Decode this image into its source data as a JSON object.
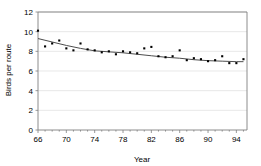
{
  "chart_data": {
    "type": "scatter",
    "title": "",
    "xlabel": "Year",
    "ylabel": "Birds per route",
    "xlim": [
      66,
      95.5
    ],
    "ylim": [
      0,
      12
    ],
    "grid": true,
    "legend": "none",
    "xticks": [
      66,
      70,
      74,
      78,
      82,
      86,
      90,
      94
    ],
    "xtick_labels": [
      "66",
      "70",
      "74",
      "78",
      "82",
      "86",
      "90",
      "94"
    ],
    "yticks": [
      0,
      2,
      4,
      6,
      8,
      10,
      12
    ],
    "ytick_labels": [
      "0",
      "2",
      "4",
      "6",
      "8",
      "10",
      "12"
    ],
    "series": [
      {
        "name": "Birds per route",
        "marker": "square",
        "color": "#000000",
        "x": [
          66,
          67,
          68,
          69,
          70,
          71,
          72,
          73,
          74,
          75,
          76,
          77,
          78,
          79,
          80,
          81,
          82,
          83,
          84,
          85,
          86,
          87,
          88,
          89,
          90,
          91,
          92,
          93,
          94,
          95
        ],
        "y": [
          10.1,
          8.5,
          8.8,
          9.1,
          8.3,
          8.1,
          8.8,
          8.2,
          8.1,
          7.9,
          8.0,
          7.7,
          8.0,
          7.9,
          7.8,
          8.3,
          8.45,
          7.5,
          7.4,
          7.5,
          8.1,
          7.1,
          7.3,
          7.2,
          7.0,
          7.1,
          7.5,
          6.8,
          6.8,
          7.2
        ]
      }
    ],
    "trend": {
      "name": "smoothed trend",
      "color": "#4d4d4d",
      "x": [
        66,
        68,
        70,
        72,
        74,
        76,
        78,
        80,
        82,
        84,
        86,
        88,
        90,
        92,
        94,
        95
      ],
      "y": [
        9.3,
        8.95,
        8.6,
        8.3,
        8.05,
        7.95,
        7.85,
        7.7,
        7.55,
        7.4,
        7.3,
        7.15,
        7.05,
        7.0,
        6.95,
        6.95
      ]
    }
  }
}
